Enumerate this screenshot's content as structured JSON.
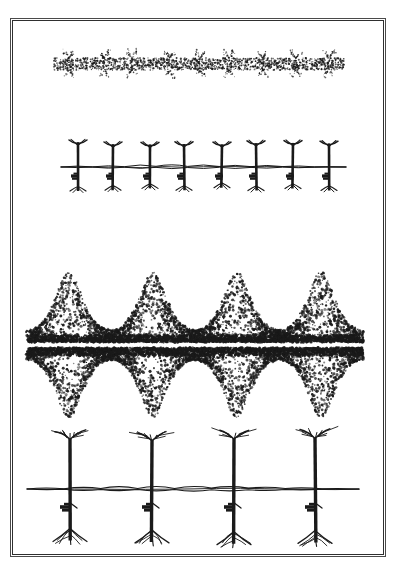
{
  "figure": {
    "background_color": "#ffffff",
    "ink_color": "#1a1a1a",
    "border_color": "#2f2f2f",
    "frame": {
      "x": 10,
      "y": 18,
      "width": 376,
      "height": 539
    }
  },
  "chart_data": {
    "type": "diagram",
    "title": "",
    "xlabel": "",
    "ylabel": "",
    "panels": [
      {
        "index": 1,
        "name": "seedling-stipple-row",
        "style": "stipple",
        "plant_count": 9,
        "soil_line_y": 64,
        "band_top": 40,
        "band_bottom": 86,
        "x_start": 53,
        "x_end": 343,
        "shoot_height": 14,
        "root_depth": 14,
        "dot_density": "very-high",
        "dot_size": 0.8
      },
      {
        "index": 2,
        "name": "young-plant-row",
        "style": "line",
        "plant_count": 8,
        "soil_line_y": 167,
        "band_top": 143,
        "band_bottom": 192,
        "x_start": 60,
        "x_end": 345,
        "shoot_height": 24,
        "root_depth": 22,
        "stem_width": 2.6
      },
      {
        "index": 3,
        "name": "dense-canopy-stipple-row",
        "style": "stipple",
        "plant_count": 4,
        "soil_line_y": 345,
        "band_top": 288,
        "band_bottom": 402,
        "x_start": 26,
        "x_end": 362,
        "shoot_height": 55,
        "root_depth": 55,
        "dot_density": "high",
        "dot_size": 1.3
      },
      {
        "index": 4,
        "name": "mature-plant-row",
        "style": "line",
        "plant_count": 4,
        "soil_line_y": 489,
        "band_top": 437,
        "band_bottom": 545,
        "x_start": 26,
        "x_end": 358,
        "shoot_height": 52,
        "root_depth": 52,
        "stem_width": 3.4
      }
    ],
    "legend": [],
    "annotations": []
  }
}
